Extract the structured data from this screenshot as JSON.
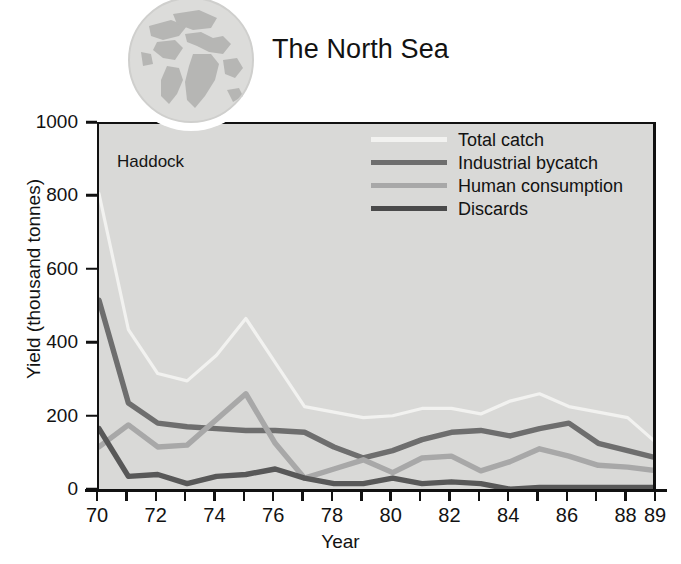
{
  "header": {
    "title": "The North Sea",
    "globe_icon": "globe-icon"
  },
  "chart_data": {
    "type": "line",
    "title": "The North Sea",
    "annotation": "Haddock",
    "xlabel": "Year",
    "ylabel": "Yield (thousand tonnes)",
    "xlim": [
      70,
      89
    ],
    "ylim": [
      0,
      1000
    ],
    "grid": false,
    "legend_position": "top-right",
    "ytick_labels": [
      "0",
      "200",
      "400",
      "600",
      "800",
      "1000"
    ],
    "ytick_values": [
      0,
      200,
      400,
      600,
      800,
      1000
    ],
    "xtick_values": [
      70,
      71,
      72,
      73,
      74,
      75,
      76,
      77,
      78,
      79,
      80,
      81,
      82,
      83,
      84,
      85,
      86,
      87,
      88,
      89
    ],
    "xtick_labels": [
      "70",
      "",
      "72",
      "",
      "74",
      "",
      "76",
      "",
      "78",
      "",
      "80",
      "",
      "82",
      "",
      "84",
      "",
      "86",
      "",
      "88",
      "89"
    ],
    "x": [
      70,
      71,
      72,
      73,
      74,
      75,
      76,
      77,
      78,
      79,
      80,
      81,
      82,
      83,
      84,
      85,
      86,
      87,
      88,
      89
    ],
    "series": [
      {
        "name": "Total catch",
        "color": "#f2f2f0",
        "width": 3.2,
        "values": [
          810,
          440,
          320,
          300,
          370,
          470,
          350,
          230,
          215,
          200,
          205,
          225,
          225,
          210,
          245,
          265,
          230,
          215,
          200,
          130
        ]
      },
      {
        "name": "Industrial bycatch",
        "color": "#6e6e6e",
        "width": 5.4,
        "values": [
          520,
          240,
          185,
          175,
          170,
          165,
          165,
          160,
          120,
          90,
          110,
          140,
          160,
          165,
          150,
          170,
          185,
          130,
          110,
          90
        ]
      },
      {
        "name": "Human consumption",
        "color": "#a8a8a8",
        "width": 5.4,
        "values": [
          120,
          180,
          120,
          125,
          195,
          265,
          130,
          35,
          60,
          85,
          50,
          90,
          95,
          55,
          80,
          115,
          95,
          70,
          65,
          55
        ]
      },
      {
        "name": "Discards",
        "color": "#585858",
        "width": 5.4,
        "values": [
          170,
          40,
          45,
          20,
          40,
          45,
          60,
          35,
          20,
          20,
          35,
          20,
          25,
          20,
          5,
          10,
          10,
          10,
          10,
          10
        ]
      }
    ],
    "legend": [
      {
        "label": "Total catch",
        "color": "#f2f2f0"
      },
      {
        "label": "Industrial bycatch",
        "color": "#6e6e6e"
      },
      {
        "label": "Human consumption",
        "color": "#a8a8a8"
      },
      {
        "label": "Discards",
        "color": "#4a4a4a"
      }
    ]
  },
  "colors": {
    "plot_background": "#d9d9d7",
    "page_background": "#ffffff",
    "axis": "#111111",
    "text": "#121212"
  }
}
